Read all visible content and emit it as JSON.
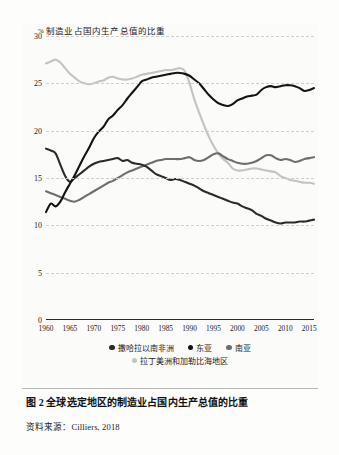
{
  "figure": {
    "caption": "图 2  全球选定地区的制造业占国内生产总值的比重",
    "source_label": "资料来源：",
    "source_value": "Cilliers, 2018"
  },
  "colors": {
    "sub_saharan_africa": "#2b2b2b",
    "east_asia": "#141414",
    "south_asia": "#6e6e6e",
    "latin_america": "#c3c3c3",
    "grid": "#cfcfcf",
    "axis": "#2a2a2a",
    "text": "#1b1b1b"
  },
  "legend": {
    "row1": [
      {
        "label": "撒哈拉以南非洲",
        "color": "#2b2b2b",
        "marker": "circle-marker"
      },
      {
        "label": "东亚",
        "color": "#141414",
        "marker": "circle-marker"
      },
      {
        "label": "南亚",
        "color": "#6e6e6e",
        "marker": "circle-marker"
      }
    ],
    "row2": [
      {
        "label": "拉丁美洲和加勒比海地区",
        "color": "#c3c3c3",
        "marker": "circle-marker"
      }
    ]
  },
  "chart_data": {
    "type": "line",
    "title": "",
    "ylabel": "% 制造业占国内生产总值的比重",
    "ylabel_unit": "%",
    "ylabel_text": "制造业占国内生产总值的比重",
    "xlabel": "",
    "ylim": [
      0,
      30
    ],
    "xlim": [
      1960,
      2016
    ],
    "yticks": [
      0,
      5,
      10,
      15,
      20,
      25,
      30
    ],
    "xticks": [
      1960,
      1965,
      1970,
      1975,
      1980,
      1985,
      1990,
      1995,
      2000,
      2005,
      2010,
      2015
    ],
    "grid": "horizontal-dashed",
    "legend_position": "below-axis",
    "x": [
      1960,
      1961,
      1962,
      1963,
      1964,
      1965,
      1966,
      1967,
      1968,
      1969,
      1970,
      1971,
      1972,
      1973,
      1974,
      1975,
      1976,
      1977,
      1978,
      1979,
      1980,
      1981,
      1982,
      1983,
      1984,
      1985,
      1986,
      1987,
      1988,
      1989,
      1990,
      1991,
      1992,
      1993,
      1994,
      1995,
      1996,
      1997,
      1998,
      1999,
      2000,
      2001,
      2002,
      2003,
      2004,
      2005,
      2006,
      2007,
      2008,
      2009,
      2010,
      2011,
      2012,
      2013,
      2014,
      2015,
      2016
    ],
    "series": [
      {
        "name": "撒哈拉以南非洲",
        "name_en": "Sub-Saharan Africa",
        "color": "#2b2b2b",
        "values": [
          18.1,
          17.9,
          17.6,
          16.4,
          15.2,
          14.6,
          15.0,
          15.4,
          15.8,
          16.2,
          16.5,
          16.7,
          16.8,
          16.9,
          17.0,
          17.1,
          16.8,
          16.9,
          16.6,
          16.5,
          16.4,
          16.2,
          15.8,
          15.4,
          15.2,
          15.0,
          14.8,
          14.9,
          14.8,
          14.6,
          14.4,
          14.2,
          13.9,
          13.6,
          13.4,
          13.2,
          13.0,
          12.8,
          12.6,
          12.4,
          12.3,
          12.0,
          11.8,
          11.6,
          11.2,
          11.0,
          10.7,
          10.5,
          10.3,
          10.2,
          10.3,
          10.3,
          10.3,
          10.4,
          10.4,
          10.5,
          10.6
        ]
      },
      {
        "name": "东亚",
        "name_en": "East Asia",
        "color": "#141414",
        "values": [
          11.4,
          12.3,
          12.0,
          12.5,
          13.5,
          14.4,
          15.3,
          16.3,
          17.3,
          18.2,
          19.2,
          19.9,
          20.4,
          21.2,
          21.6,
          22.2,
          22.7,
          23.4,
          24.0,
          24.6,
          25.2,
          25.4,
          25.6,
          25.7,
          25.8,
          25.9,
          26.0,
          26.1,
          26.1,
          26.0,
          25.8,
          25.4,
          25.0,
          24.4,
          23.8,
          23.3,
          22.9,
          22.7,
          22.6,
          22.8,
          23.2,
          23.4,
          23.6,
          23.7,
          23.8,
          24.3,
          24.6,
          24.7,
          24.6,
          24.7,
          24.8,
          24.8,
          24.7,
          24.5,
          24.2,
          24.3,
          24.5
        ]
      },
      {
        "name": "南亚",
        "name_en": "South Asia",
        "color": "#6e6e6e",
        "values": [
          13.6,
          13.4,
          13.2,
          13.0,
          12.8,
          12.6,
          12.5,
          12.7,
          13.0,
          13.3,
          13.6,
          13.9,
          14.2,
          14.5,
          14.7,
          15.0,
          15.3,
          15.6,
          15.8,
          16.0,
          16.2,
          16.4,
          16.6,
          16.8,
          16.9,
          17.0,
          17.0,
          17.0,
          17.0,
          17.1,
          17.2,
          16.9,
          16.8,
          16.9,
          17.2,
          17.5,
          17.6,
          17.3,
          17.0,
          16.8,
          16.6,
          16.5,
          16.5,
          16.6,
          16.8,
          17.1,
          17.4,
          17.4,
          17.1,
          16.9,
          17.0,
          16.9,
          16.7,
          16.8,
          17.0,
          17.1,
          17.2
        ]
      },
      {
        "name": "拉丁美洲和加勒比海地区",
        "name_en": "Latin America & Caribbean",
        "color": "#c3c3c3",
        "values": [
          27.1,
          27.3,
          27.5,
          27.2,
          26.6,
          26.0,
          25.6,
          25.2,
          25.0,
          24.9,
          25.0,
          25.2,
          25.3,
          25.6,
          25.7,
          25.5,
          25.4,
          25.4,
          25.5,
          25.7,
          25.9,
          26.0,
          26.1,
          26.2,
          26.3,
          26.4,
          26.4,
          26.5,
          26.6,
          26.3,
          25.0,
          23.3,
          21.9,
          20.6,
          19.4,
          18.4,
          17.6,
          17.0,
          16.6,
          16.0,
          15.8,
          15.8,
          15.9,
          16.0,
          16.0,
          15.9,
          15.8,
          15.7,
          15.6,
          15.2,
          15.0,
          14.8,
          14.7,
          14.6,
          14.5,
          14.5,
          14.4
        ]
      }
    ]
  }
}
